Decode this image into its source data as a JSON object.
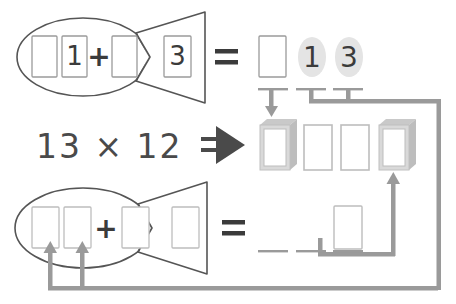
{
  "page": {
    "background_color": "#ffffff",
    "outline_color": "#555555",
    "box_border_color": "#9a9a9a",
    "digit_color": "#3b3b3b",
    "arrow_color": "#9a9a9a",
    "dark_arrow_color": "#4a4a4a",
    "highlight_ellipse_color": "#e2e2e2",
    "shadow_color": "#c9c9c9"
  },
  "top_row": {
    "name": "top-fish-equation",
    "fish_boxes": [
      {
        "id": "t-b1",
        "value": "",
        "name": "top-fish-box-1"
      },
      {
        "id": "t-b2",
        "value": "1",
        "name": "top-fish-box-2"
      },
      {
        "id": "t-b3",
        "value": "",
        "name": "top-fish-box-3"
      },
      {
        "id": "t-b4",
        "value": "3",
        "name": "top-fish-box-4"
      }
    ],
    "plus_sign": "+",
    "equals_sign": "=",
    "result_boxes": [
      {
        "id": "t-r1",
        "value": "",
        "highlighted": false,
        "name": "top-result-box-1"
      },
      {
        "id": "t-r2",
        "value": "1",
        "highlighted": true,
        "name": "top-result-digit-1"
      },
      {
        "id": "t-r3",
        "value": "3",
        "highlighted": true,
        "name": "top-result-digit-3"
      }
    ]
  },
  "middle_row": {
    "name": "middle-problem-row",
    "problem": "13 × 12",
    "multiplicand": "13",
    "times_sign": "×",
    "multiplier": "12",
    "implies_arrow": "⇒",
    "answer_boxes": [
      {
        "id": "m-1",
        "value": "",
        "raised": true,
        "name": "answer-box-1"
      },
      {
        "id": "m-2",
        "value": "",
        "raised": false,
        "name": "answer-box-2"
      },
      {
        "id": "m-3",
        "value": "",
        "raised": false,
        "name": "answer-box-3"
      },
      {
        "id": "m-4",
        "value": "",
        "raised": true,
        "name": "answer-box-4"
      }
    ]
  },
  "bottom_row": {
    "name": "bottom-fish-equation",
    "fish_boxes": [
      {
        "id": "b-b1",
        "value": "",
        "name": "bottom-fish-box-1"
      },
      {
        "id": "b-b2",
        "value": "",
        "name": "bottom-fish-box-2"
      },
      {
        "id": "b-b3",
        "value": "",
        "name": "bottom-fish-box-3"
      },
      {
        "id": "b-b4",
        "value": "",
        "name": "bottom-fish-box-4"
      }
    ],
    "plus_sign": "+",
    "equals_sign": "=",
    "blank_lines": 3,
    "result_box": {
      "id": "b-r1",
      "value": "",
      "name": "bottom-result-box"
    }
  },
  "connectors": {
    "down_arrow_from_result_1": "arrow-down-to-answer-box-1",
    "digits_bus_to_right": "bus-from-digits-to-right-edge",
    "up_arrow_to_answer_box_4": "arrow-up-to-answer-box-4",
    "bottom_bus_to_fish": "bus-from-right-edge-to-bottom-fish",
    "up_arrows_into_bottom_fish": 2
  }
}
